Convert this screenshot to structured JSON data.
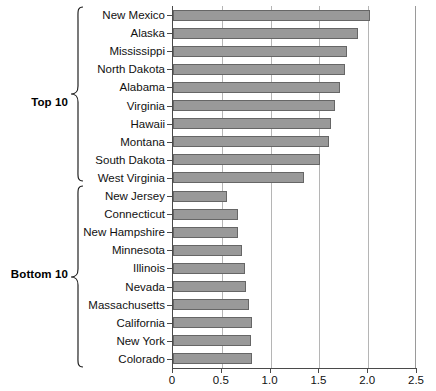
{
  "chart_data": {
    "type": "bar",
    "orientation": "horizontal",
    "title": "",
    "xlabel": "",
    "ylabel": "",
    "xlim": [
      0,
      2.5
    ],
    "xticks": [
      "0",
      "0.5",
      "1.0",
      "1.5",
      "2.0",
      "2.5"
    ],
    "xtick_values": [
      0,
      0.5,
      1.0,
      1.5,
      2.0,
      2.5
    ],
    "grid": true,
    "grid_axis": "x",
    "legend": "none",
    "bar_color": "#999999",
    "bar_edge_color": "#666666",
    "categories": [
      "New Mexico",
      "Alaska",
      "Mississippi",
      "North Dakota",
      "Alabama",
      "Virginia",
      "Hawaii",
      "Montana",
      "South Dakota",
      "West Virginia",
      "New Jersey",
      "Connecticut",
      "New Hampshire",
      "Minnesota",
      "Illinois",
      "Nevada",
      "Massachusetts",
      "California",
      "New York",
      "Colorado"
    ],
    "values": [
      2.02,
      1.9,
      1.78,
      1.76,
      1.71,
      1.66,
      1.62,
      1.6,
      1.51,
      1.34,
      0.55,
      0.67,
      0.67,
      0.71,
      0.74,
      0.75,
      0.78,
      0.81,
      0.8,
      0.81
    ],
    "groups": [
      {
        "label": "Top 10",
        "start": 0,
        "end": 9
      },
      {
        "label": "Bottom 10",
        "start": 10,
        "end": 19
      }
    ]
  }
}
